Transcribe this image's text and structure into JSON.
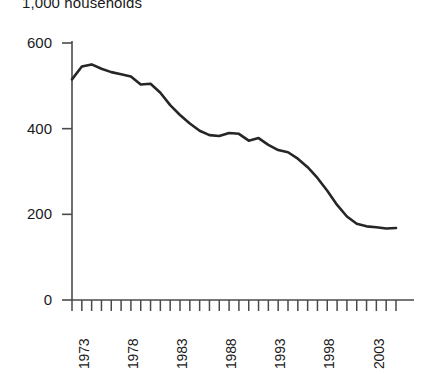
{
  "chart_data": {
    "type": "line",
    "title": "1,000 households",
    "xlabel": "",
    "ylabel": "",
    "ylim": [
      0,
      600
    ],
    "xlim": [
      1973,
      2006
    ],
    "grid": false,
    "legend": null,
    "y_ticks": [
      0,
      200,
      400,
      600
    ],
    "y_tick_labels": [
      "0",
      "200",
      "400",
      "600"
    ],
    "x_tick_labels": [
      "1973",
      "1978",
      "1983",
      "1988",
      "1993",
      "1998",
      "2003"
    ],
    "x_tick_label_years": [
      1973,
      1978,
      1983,
      1988,
      1993,
      1998,
      2003
    ],
    "x_minor_tick_years": [
      1973,
      1974,
      1975,
      1976,
      1977,
      1978,
      1979,
      1980,
      1981,
      1982,
      1983,
      1984,
      1985,
      1986,
      1987,
      1988,
      1989,
      1990,
      1991,
      1992,
      1993,
      1994,
      1995,
      1996,
      1997,
      1998,
      1999,
      2000,
      2001,
      2002,
      2003,
      2004,
      2005,
      2006
    ],
    "line_color": "#262626",
    "line_width": 2.6,
    "x": [
      1973,
      1974,
      1975,
      1976,
      1977,
      1978,
      1979,
      1980,
      1981,
      1982,
      1983,
      1984,
      1985,
      1986,
      1987,
      1988,
      1989,
      1990,
      1991,
      1992,
      1993,
      1994,
      1995,
      1996,
      1997,
      1998,
      1999,
      2000,
      2001,
      2002,
      2003,
      2004,
      2005,
      2006
    ],
    "values": [
      515,
      545,
      550,
      540,
      532,
      527,
      522,
      503,
      505,
      484,
      455,
      432,
      412,
      395,
      385,
      383,
      390,
      388,
      372,
      378,
      362,
      350,
      345,
      330,
      310,
      285,
      255,
      222,
      195,
      178,
      172,
      170,
      167,
      168
    ],
    "series": [
      {
        "name": "1,000 households",
        "values": [
          515,
          545,
          550,
          540,
          532,
          527,
          522,
          503,
          505,
          484,
          455,
          432,
          412,
          395,
          385,
          383,
          390,
          388,
          372,
          378,
          362,
          350,
          345,
          330,
          310,
          285,
          255,
          222,
          195,
          178,
          172,
          170,
          167,
          168
        ]
      }
    ]
  }
}
